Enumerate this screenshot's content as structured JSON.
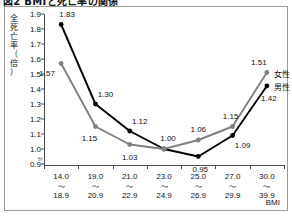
{
  "title": "図2  BMIと死亡率の関係",
  "axis_title_x": "BMI",
  "axis_title_y_chars": [
    "全",
    "死",
    "亡",
    "率",
    "（",
    "倍",
    "）"
  ],
  "legend": {
    "female_label": "女性",
    "male_label": "男性"
  },
  "chart_data": {
    "type": "line",
    "title": "図2  BMIと死亡率の関係",
    "xlabel": "BMI",
    "ylabel": "全死亡率（倍）",
    "categories": [
      "14.0\n～\n18.9",
      "19.0\n～\n20.9",
      "21.0\n～\n22.9",
      "23.0\n～\n24.9",
      "25.0\n～\n26.9",
      "27.0\n～\n29.9",
      "30.0\n～\n39.9"
    ],
    "category_parts": [
      {
        "from": "14.0",
        "sep": "～",
        "to": "18.9"
      },
      {
        "from": "19.0",
        "sep": "～",
        "to": "20.9"
      },
      {
        "from": "21.0",
        "sep": "～",
        "to": "22.9"
      },
      {
        "from": "23.0",
        "sep": "～",
        "to": "24.9"
      },
      {
        "from": "25.0",
        "sep": "～",
        "to": "26.9"
      },
      {
        "from": "27.0",
        "sep": "～",
        "to": "29.9"
      },
      {
        "from": "30.0",
        "sep": "～",
        "to": "39.9"
      }
    ],
    "ylim": [
      0.9,
      1.9
    ],
    "yticks": [
      "1.9",
      "1.8",
      "1.7",
      "1.6",
      "1.5",
      "1.4",
      "1.3",
      "1.2",
      "1.1",
      "1.0",
      "0.9"
    ],
    "y_axis_break": true,
    "grid": false,
    "legend_position": "right-inside",
    "series": [
      {
        "name": "男性",
        "color": "#000000",
        "values": [
          1.83,
          1.3,
          1.12,
          1.0,
          0.95,
          1.09,
          1.42
        ],
        "labels": [
          "1.83",
          "1.30",
          "1.12",
          "1.00",
          "0.95",
          "1.09",
          "1.42"
        ]
      },
      {
        "name": "女性",
        "color": "#808080",
        "values": [
          1.57,
          1.15,
          1.03,
          1.0,
          1.06,
          1.15,
          1.51
        ],
        "labels": [
          "1.57",
          "1.15",
          "1.03",
          "1.00",
          "1.06",
          "1.15",
          "1.51"
        ]
      }
    ]
  }
}
